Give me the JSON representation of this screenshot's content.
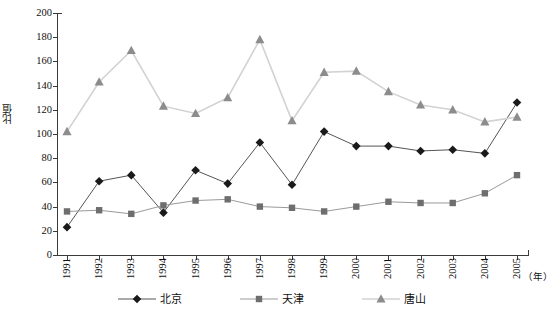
{
  "chart_data": {
    "type": "line",
    "title": "",
    "xlabel": "（年）",
    "ylabel": "比值",
    "x": [
      1991,
      1992,
      1993,
      1994,
      1995,
      1996,
      1997,
      1998,
      1999,
      2000,
      2001,
      2002,
      2003,
      2004,
      2005
    ],
    "categories": [
      "1991",
      "1992",
      "1993",
      "1994",
      "1995",
      "1996",
      "1997",
      "1998",
      "1999",
      "2000",
      "2001",
      "2002",
      "2003",
      "2004",
      "2005"
    ],
    "ylim": [
      0,
      200
    ],
    "yticks": [
      0,
      20,
      40,
      60,
      80,
      100,
      120,
      140,
      160,
      180,
      200
    ],
    "ytick_labels": [
      "0",
      "20",
      "40",
      "60",
      "80",
      "100",
      "120",
      "140",
      "160",
      "180",
      "200"
    ],
    "grid": false,
    "legend_position": "bottom",
    "series": [
      {
        "name": "北京",
        "marker": "diamond",
        "color": "#1a1a1a",
        "line_color": "#555555",
        "values": [
          23,
          61,
          66,
          35,
          70,
          59,
          93,
          58,
          102,
          90,
          90,
          86,
          87,
          84,
          126
        ]
      },
      {
        "name": "天津",
        "marker": "square",
        "color": "#6e6e6e",
        "line_color": "#9a9a9a",
        "values": [
          36,
          37,
          34,
          41,
          45,
          46,
          40,
          39,
          36,
          40,
          44,
          43,
          43,
          51,
          66
        ]
      },
      {
        "name": "唐山",
        "marker": "triangle",
        "color": "#8c8c8c",
        "line_color": "#d2d2d2",
        "values": [
          102,
          143,
          169,
          123,
          117,
          130,
          178,
          111,
          151,
          152,
          135,
          124,
          120,
          110,
          114
        ]
      }
    ]
  },
  "axes": {
    "y_title": "比值",
    "x_unit": "（年）"
  },
  "legend": {
    "entries": [
      {
        "label": "北京"
      },
      {
        "label": "天津"
      },
      {
        "label": "唐山"
      }
    ]
  }
}
